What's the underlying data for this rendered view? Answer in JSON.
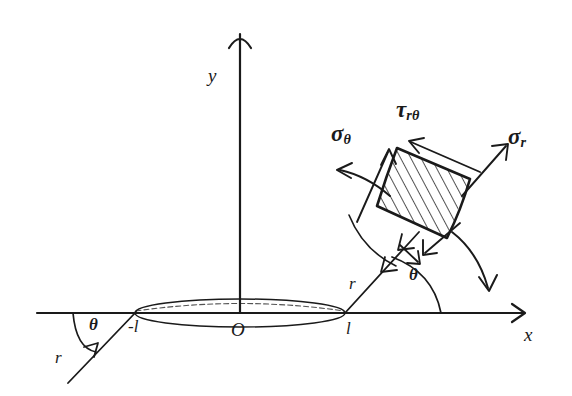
{
  "figure": {
    "background_color": "#ffffff",
    "line_color": "#1a1a1a"
  },
  "axes": {
    "x_label": "x",
    "y_label": "y",
    "origin_label": "O"
  },
  "crack": {
    "left_tip_label": "-l",
    "right_tip_label": "l",
    "shape": "ellipse"
  },
  "polar_right": {
    "radius_label": "r",
    "angle_label": "θ"
  },
  "polar_left": {
    "radius_label": "r",
    "angle_label": "θ"
  },
  "stresses": {
    "hoop": {
      "symbol": "σ",
      "subscript": "θ"
    },
    "shear": {
      "symbol": "τ",
      "subscript": "rθ"
    },
    "radial": {
      "symbol": "σ",
      "subscript": "r"
    }
  },
  "element": {
    "hatching": "diagonal-lines",
    "description": "curved polar element"
  }
}
